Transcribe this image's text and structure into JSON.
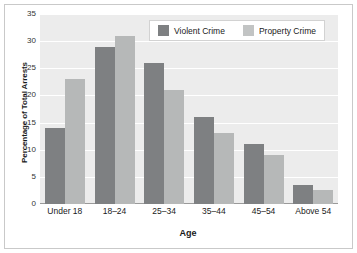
{
  "chart_data": {
    "type": "bar",
    "title": "",
    "xlabel": "Age",
    "ylabel": "Percentage of Total Arrests",
    "categories": [
      "Under 18",
      "18–24",
      "25–34",
      "35–44",
      "45–54",
      "Above 54"
    ],
    "series": [
      {
        "name": "Violent Crime",
        "color": "#7e8082",
        "values": [
          14,
          29,
          26,
          16,
          11,
          3.5
        ]
      },
      {
        "name": "Property Crime",
        "color": "#b6b8b8",
        "values": [
          23,
          31,
          21,
          13,
          9,
          2.5
        ]
      }
    ],
    "ylim": [
      0,
      35
    ],
    "yticks": [
      0,
      5,
      10,
      15,
      20,
      25,
      30,
      35
    ],
    "ytick_labels": [
      "0",
      "5",
      "10",
      "15",
      "20",
      "25",
      "30",
      "35"
    ],
    "grid": true,
    "legend_position": "top-right",
    "plot_background": "#ececec",
    "figure_background": "#ffffff"
  }
}
